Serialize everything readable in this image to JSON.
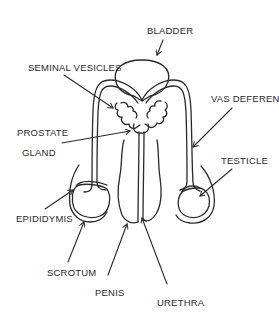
{
  "diagram": {
    "type": "anatomical-line-drawing",
    "stroke_color": "#2a2a2a",
    "background_color": "#ffffff",
    "labels": [
      {
        "id": "bladder",
        "text": "BLADDER",
        "x": 147,
        "y": 34
      },
      {
        "id": "seminal-vesicles",
        "text": "SEMINAL VESICLES",
        "x": 28,
        "y": 71
      },
      {
        "id": "vas-deferens",
        "text": "VAS DEFERENS",
        "x": 211,
        "y": 102
      },
      {
        "id": "prostate-gland-line1",
        "text": "PROSTATE",
        "x": 17,
        "y": 136
      },
      {
        "id": "prostate-gland-line2",
        "text": "GLAND",
        "x": 22,
        "y": 156
      },
      {
        "id": "testicle",
        "text": "TESTICLE",
        "x": 221,
        "y": 164
      },
      {
        "id": "epididymis",
        "text": "EPIDIDYMIS",
        "x": 16,
        "y": 222
      },
      {
        "id": "scrotum",
        "text": "SCROTUM",
        "x": 47,
        "y": 276
      },
      {
        "id": "penis",
        "text": "PENIS",
        "x": 95,
        "y": 296
      },
      {
        "id": "urethra",
        "text": "URETHRA",
        "x": 157,
        "y": 306
      }
    ]
  }
}
